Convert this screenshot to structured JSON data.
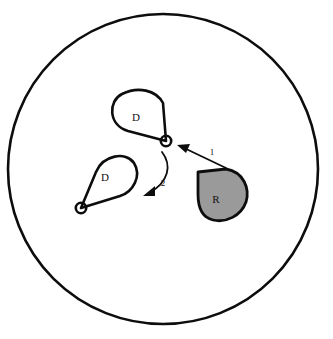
{
  "figure": {
    "background_color": "#ffffff",
    "stroke_color": "#0d0d0d",
    "universe": {
      "name": "outer-boundary-circle",
      "cx": 163,
      "cy": 169,
      "r": 155,
      "stroke_width": 2.6,
      "fill": "none"
    },
    "shapes": [
      {
        "id": "teardrop-upper",
        "label": "D",
        "label_x": 136,
        "label_y": 118,
        "fill": "#ffffff",
        "stroke_width": 2.6,
        "node": {
          "cx": 166,
          "cy": 141,
          "r": 5.2
        },
        "path": "M 166 141 L 128 131 C 108 125 108 101 122 94 C 138 86 156 90 163 103 L 166 141 Z"
      },
      {
        "id": "teardrop-lower",
        "label": "D",
        "label_x": 105,
        "label_y": 178,
        "fill": "#ffffff",
        "stroke_width": 2.6,
        "node": {
          "cx": 81,
          "cy": 208,
          "r": 5.2
        },
        "path": "M 81 208 L 96 172 C 103 155 126 151 134 163 C 142 176 133 192 120 196 L 81 208 Z"
      },
      {
        "id": "region-filled",
        "label": "R",
        "label_x": 216,
        "label_y": 200,
        "fill": "#9a9a9a",
        "stroke_width": 2.8,
        "path": "M 198 172 L 226 169 C 244 172 250 189 246 202 C 241 216 226 223 213 220 C 200 217 198 205 198 194 Z"
      }
    ],
    "arrows": [
      {
        "id": "arrow-1",
        "label": "1",
        "label_x": 212,
        "label_y": 153,
        "type": "straight",
        "from": {
          "x": 226,
          "y": 168
        },
        "to": {
          "x": 178,
          "y": 145
        },
        "stroke_width": 1.8
      },
      {
        "id": "arrow-2",
        "label": "2",
        "label_x": 163,
        "label_y": 184,
        "type": "curved",
        "path": "M 162 152 C 172 165 169 182 145 195",
        "to": {
          "x": 145,
          "y": 195
        },
        "stroke_width": 1.8
      }
    ]
  }
}
